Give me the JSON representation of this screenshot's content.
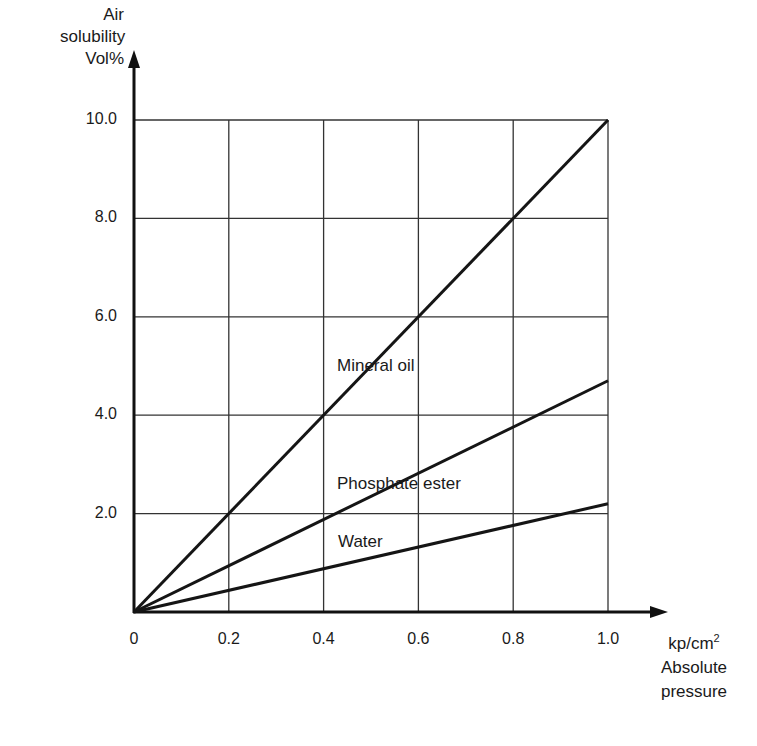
{
  "chart_data": {
    "type": "line",
    "title": "",
    "ylabel": [
      "Air",
      "solubility",
      "Vol%"
    ],
    "xlabel": [
      "kp/cm2",
      "Absolute",
      "pressure"
    ],
    "x_unit_base": "kp/cm",
    "x_unit_sup": "2",
    "xlim": [
      0,
      1.0
    ],
    "ylim": [
      0,
      10.0
    ],
    "grid": true,
    "x_ticks": [
      "0",
      "0.2",
      "0.4",
      "0.6",
      "0.8",
      "1.0"
    ],
    "y_ticks": [
      "2.0",
      "4.0",
      "6.0",
      "8.0",
      "10.0"
    ],
    "series": [
      {
        "name": "Mineral oil",
        "x": [
          0,
          1.0
        ],
        "y": [
          0,
          10.0
        ]
      },
      {
        "name": "Phosphate ester",
        "x": [
          0,
          1.0
        ],
        "y": [
          0,
          4.7
        ]
      },
      {
        "name": "Water",
        "x": [
          0,
          1.0
        ],
        "y": [
          0,
          2.2
        ]
      }
    ],
    "annotations": [
      {
        "text": "Mineral oil",
        "x": 0.42,
        "y": 5.0
      },
      {
        "text": "Phosphate ester",
        "x": 0.42,
        "y": 2.6
      },
      {
        "text": "Water",
        "x": 0.42,
        "y": 1.4
      }
    ]
  }
}
